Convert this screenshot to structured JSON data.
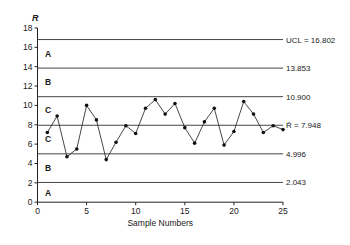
{
  "chart_data": {
    "type": "line",
    "title": "",
    "xlabel": "Sample Numbers",
    "ylabel": "R",
    "xlim": [
      0,
      25
    ],
    "ylim": [
      0,
      18
    ],
    "x_ticks": [
      0,
      5,
      10,
      15,
      20,
      25
    ],
    "y_ticks": [
      0,
      2,
      4,
      6,
      8,
      10,
      12,
      14,
      16,
      18
    ],
    "grid": false,
    "x": [
      1,
      2,
      3,
      4,
      5,
      6,
      7,
      8,
      9,
      10,
      11,
      12,
      13,
      14,
      15,
      16,
      17,
      18,
      19,
      20,
      21,
      22,
      23,
      24,
      25
    ],
    "series": [
      {
        "name": "R",
        "values": [
          7.2,
          8.9,
          4.7,
          5.5,
          10.0,
          8.5,
          4.4,
          6.2,
          7.9,
          7.1,
          9.7,
          10.6,
          9.1,
          10.2,
          7.7,
          6.1,
          8.3,
          9.7,
          5.9,
          7.3,
          10.4,
          9.1,
          7.2,
          7.9,
          7.5
        ]
      }
    ],
    "reference_lines": [
      {
        "name": "UCL",
        "value": 16.802,
        "label": "UCL = 16.802"
      },
      {
        "name": "zone-AB-upper",
        "value": 13.853,
        "label": "13.853"
      },
      {
        "name": "zone-BC-upper",
        "value": 10.9,
        "label": "10.900"
      },
      {
        "name": "center-line",
        "value": 7.948,
        "label": "R̄ = 7.948"
      },
      {
        "name": "zone-BC-lower",
        "value": 4.996,
        "label": "4.996"
      },
      {
        "name": "zone-AB-lower",
        "value": 2.043,
        "label": "2.043"
      }
    ],
    "zone_labels": [
      {
        "label": "A",
        "y": 15.3
      },
      {
        "label": "B",
        "y": 12.4
      },
      {
        "label": "C",
        "y": 9.5
      },
      {
        "label": "C",
        "y": 6.5
      },
      {
        "label": "B",
        "y": 3.5
      },
      {
        "label": "A",
        "y": 0.9
      }
    ]
  }
}
